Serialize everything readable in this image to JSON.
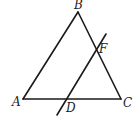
{
  "diagram": {
    "type": "geometry",
    "stroke_color": "#1a1a1a",
    "points": {
      "A": {
        "label": "A",
        "x": 23,
        "y": 99,
        "label_x": 12,
        "label_y": 106
      },
      "B": {
        "label": "B",
        "x": 78,
        "y": 12,
        "label_x": 74,
        "label_y": 9
      },
      "C": {
        "label": "C",
        "x": 121,
        "y": 99,
        "label_x": 123,
        "label_y": 107
      },
      "D": {
        "label": "D",
        "x": 66,
        "y": 99,
        "label_x": 66,
        "label_y": 112
      },
      "F": {
        "label": "F",
        "x": 96,
        "y": 50,
        "label_x": 99,
        "label_y": 53
      }
    },
    "segments": [
      {
        "from": "A",
        "to": "B"
      },
      {
        "from": "B",
        "to": "C"
      },
      {
        "from": "A",
        "to": "C"
      }
    ],
    "transversal": {
      "x1": 57,
      "y1": 115,
      "x2": 106,
      "y2": 34,
      "passes_through": [
        "D",
        "F"
      ]
    }
  }
}
